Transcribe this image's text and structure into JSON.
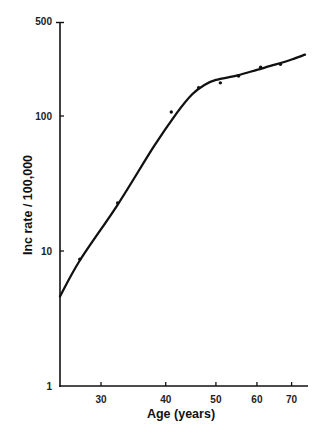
{
  "chart_data": {
    "type": "line",
    "title": "",
    "xlabel": "Age (years)",
    "ylabel": "Inc rate / 100,000",
    "xscale": "log",
    "yscale": "log",
    "xlim": [
      25,
      76
    ],
    "ylim": [
      1,
      500
    ],
    "x_ticks": [
      30,
      40,
      50,
      60,
      70
    ],
    "y_ticks": [
      1,
      10,
      100,
      500
    ],
    "grid": false,
    "legend": null,
    "series": [
      {
        "name": "fitted curve",
        "style": "line",
        "x": [
          25,
          27.3,
          32.3,
          38,
          42,
          45,
          47.5,
          50,
          55,
          60,
          65,
          70,
          74.3
        ],
        "values": [
          4.6,
          8.5,
          22,
          60,
          105,
          145,
          170,
          185,
          200,
          220,
          240,
          262,
          285
        ]
      },
      {
        "name": "observed",
        "style": "points",
        "x": [
          27.3,
          32.3,
          41,
          46.3,
          51.0,
          55.3,
          61.0,
          66.6
        ],
        "values": [
          8.7,
          22.7,
          107,
          162,
          176,
          198,
          230,
          242
        ]
      }
    ]
  },
  "labels": {
    "xlabel": "Age (years)",
    "ylabel": "Inc rate / 100,000",
    "x_ticks": [
      "30",
      "40",
      "50",
      "60",
      "70"
    ],
    "y_ticks": [
      "1",
      "10",
      "100",
      "500"
    ]
  }
}
